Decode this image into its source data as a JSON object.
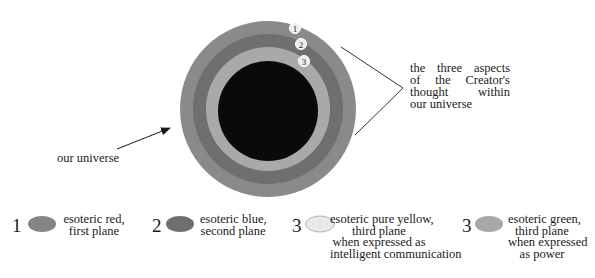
{
  "diagram": {
    "rings": [
      {
        "id": 1,
        "name": "esoteric red, first plane",
        "color": "#8a8a8a",
        "radius": 88
      },
      {
        "id": 2,
        "name": "esoteric blue, second plane",
        "color": "#6f6f6f",
        "radius": 75
      },
      {
        "id": 3,
        "name": "esoteric pure yellow / green, third plane",
        "color": "#a9a9a9",
        "radius": 62
      },
      {
        "id": 0,
        "name": "our universe core",
        "color": "#0a0a0a",
        "radius": 50
      }
    ],
    "ring_badges": [
      "1",
      "2",
      "3"
    ],
    "annotation_right": {
      "lines": [
        "the three aspects",
        "of the Creator's",
        "thought within",
        "our universe"
      ]
    },
    "annotation_left": {
      "text": "our universe"
    }
  },
  "legend": [
    {
      "number": "1",
      "swatch_color": "#858585",
      "lines": [
        "esoteric red,",
        "first plane"
      ]
    },
    {
      "number": "2",
      "swatch_color": "#6e6e6e",
      "lines": [
        "esoteric blue,",
        "second plane"
      ]
    },
    {
      "number": "3",
      "swatch_color": "#e6e6e6",
      "lines": [
        "esoteric pure yellow,",
        "third plane",
        "when expressed as",
        "intelligent communication"
      ]
    },
    {
      "number": "3",
      "swatch_color": "#a8a8a8",
      "lines": [
        "esoteric green,",
        "third plane",
        "when expressed",
        "as power"
      ]
    }
  ]
}
